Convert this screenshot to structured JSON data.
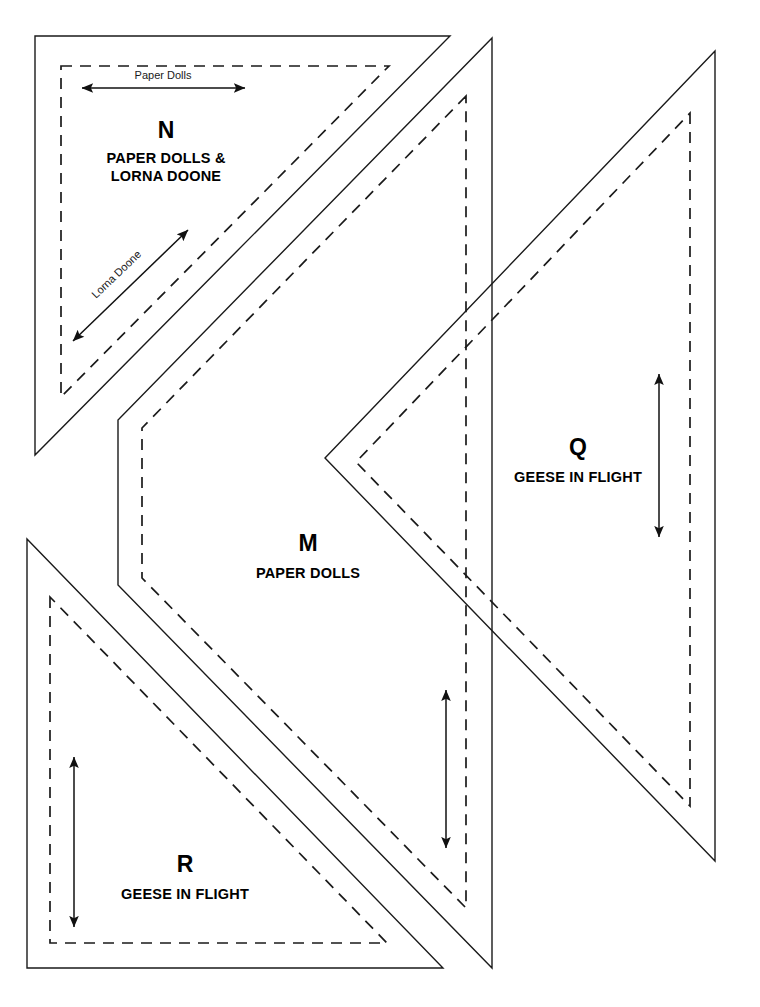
{
  "sheet": {
    "title": "Quilt Template Pattern Sheet",
    "background_color": "#ffffff",
    "line_color": "#1a1a1a",
    "width": 760,
    "height": 1007
  },
  "templates": [
    {
      "id": "N",
      "letter": "N",
      "name_line_1": "PAPER DOLLS &",
      "name_line_2": "LORNA DOONE",
      "shape": "right-triangle",
      "cut_path": "M 35 36 L 450 36 L 35 455 Z",
      "seam_path": "M 61 66 L 389 66 L 61 397 Z",
      "letter_pos": {
        "x": 166,
        "y": 138
      },
      "name_1_pos": {
        "x": 166,
        "y": 163
      },
      "name_2_pos": {
        "x": 166,
        "y": 181
      },
      "grain_arrows": [
        {
          "label": "Paper Dolls",
          "orientation": "horizontal",
          "x1": 82,
          "y1": 88,
          "x2": 245,
          "y2": 88,
          "label_x": 163,
          "label_y": 79,
          "label_rotate": 0
        },
        {
          "label": "Lorna Doone",
          "orientation": "diagonal",
          "x1": 73,
          "y1": 341,
          "x2": 188,
          "y2": 230,
          "label_x": 119,
          "label_y": 277,
          "label_rotate": -44
        }
      ]
    },
    {
      "id": "M",
      "letter": "M",
      "name_line_1": "PAPER DOLLS",
      "name_line_2": "",
      "shape": "chevron-band",
      "cut_path": "M 492 38 L 118 420 L 118 585 L 492 968 Z",
      "seam_path": "M 466 96 L 142 428 L 142 578 L 466 908 Z",
      "letter_pos": {
        "x": 308,
        "y": 551
      },
      "name_1_pos": {
        "x": 308,
        "y": 578
      },
      "grain_arrows": [
        {
          "label": "",
          "orientation": "vertical",
          "x1": 446,
          "y1": 690,
          "x2": 446,
          "y2": 848,
          "label_x": 0,
          "label_y": 0,
          "label_rotate": 0
        }
      ]
    },
    {
      "id": "Q",
      "letter": "Q",
      "name_line_1": "GEESE IN FLIGHT",
      "name_line_2": "",
      "shape": "right-triangle",
      "cut_path": "M 715 51 L 715 861 L 325 458 Z",
      "seam_path": "M 690 113 L 690 806 L 356 462 Z",
      "letter_pos": {
        "x": 578,
        "y": 455
      },
      "name_1_pos": {
        "x": 578,
        "y": 482
      },
      "grain_arrows": [
        {
          "label": "",
          "orientation": "vertical",
          "x1": 659,
          "y1": 374,
          "x2": 659,
          "y2": 537,
          "label_x": 0,
          "label_y": 0,
          "label_rotate": 0
        }
      ]
    },
    {
      "id": "R",
      "letter": "R",
      "name_line_1": "GEESE IN FLIGHT",
      "name_line_2": "",
      "shape": "right-triangle",
      "cut_path": "M 27 539 L 27 968 L 443 968 Z",
      "seam_path": "M 50 597 L 50 943 L 387 943 Z",
      "letter_pos": {
        "x": 185,
        "y": 872
      },
      "name_1_pos": {
        "x": 185,
        "y": 899
      },
      "grain_arrows": [
        {
          "label": "",
          "orientation": "vertical",
          "x1": 74,
          "y1": 757,
          "x2": 74,
          "y2": 927,
          "label_x": 0,
          "label_y": 0,
          "label_rotate": 0
        }
      ]
    }
  ]
}
